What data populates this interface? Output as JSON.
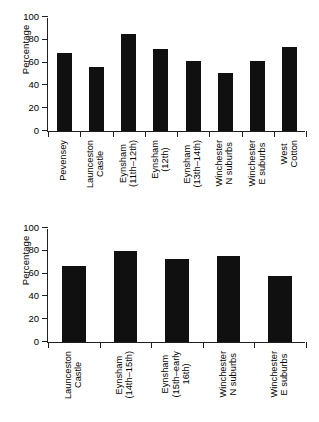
{
  "figure": {
    "background": "#ffffff",
    "bar_color": "#101010",
    "axis_color": "#231f20"
  },
  "chart_data": [
    {
      "type": "bar",
      "panel": "top",
      "title": "",
      "xlabel": "",
      "ylabel": "Percentage",
      "ylim": [
        0,
        100
      ],
      "yticks": [
        0,
        20,
        40,
        60,
        80,
        100
      ],
      "grid": false,
      "legend": "none",
      "categories": [
        "Pevensey",
        "Launceston\nCastle",
        "Eynsham\n(11th–12th)",
        "Eynsham\n(12th)",
        "Eynsham\n(13th–14th)",
        "Winchester\nN suburbs",
        "Winchester\nE suburbs",
        "West\nCotton"
      ],
      "category_lines": [
        [
          "Pevensey"
        ],
        [
          "Launceston",
          "Castle"
        ],
        [
          "Eynsham",
          "(11th–12th)"
        ],
        [
          "Eynsham",
          "(12th)"
        ],
        [
          "Eynsham",
          "(13th–14th)"
        ],
        [
          "Winchester",
          "N suburbs"
        ],
        [
          "Winchester",
          "E suburbs"
        ],
        [
          "West",
          "Cotton"
        ]
      ],
      "values": [
        68,
        56,
        85,
        72,
        61,
        51,
        61.5,
        74
      ]
    },
    {
      "type": "bar",
      "panel": "bottom",
      "title": "",
      "xlabel": "",
      "ylabel": "Percentage",
      "ylim": [
        0,
        100
      ],
      "yticks": [
        0,
        20,
        40,
        60,
        80,
        100
      ],
      "grid": false,
      "legend": "none",
      "categories": [
        "Launceston\nCastle",
        "Eynsham\n(14th–15th)",
        "Eynsham\n(15th–early\n16th)",
        "Winchester\nN suburbs",
        "Winchester\nE suburbs"
      ],
      "category_lines": [
        [
          "Launceston",
          "Castle"
        ],
        [
          "Eynsham",
          "(14th–15th)"
        ],
        [
          "Eynsham",
          "(15th–early",
          "16th)"
        ],
        [
          "Winchester",
          "N suburbs"
        ],
        [
          "Winchester",
          "E suburbs"
        ]
      ],
      "values": [
        67,
        80,
        72.5,
        75.5,
        57.5
      ]
    }
  ]
}
